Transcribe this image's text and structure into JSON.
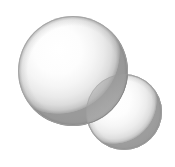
{
  "figure": {
    "type": "illustration",
    "background_color": "#ffffff",
    "width": 175,
    "height": 167,
    "alt_text": "Two overlapping shaded spheres, a large one at upper left and a smaller one at lower right, with a darker lens-shaped intersection region"
  },
  "palette": {
    "background": "#ffffff",
    "highlight": "#ffffff",
    "body_light": "#f7f7f7",
    "body_mid": "#e3e3e3",
    "rim_gray": "#b9b9b9",
    "rim_dark": "#8f8f8f",
    "outline": "#9c9c9c",
    "lens_fill": "#a8a8a8",
    "lens_edge": "#7d7d7d"
  },
  "shapes": [
    {
      "name": "large-sphere",
      "label": "Large sphere",
      "cx": 73,
      "cy": 71,
      "r": 55,
      "highlight_cx": 58,
      "highlight_cy": 52,
      "highlight_r": 62,
      "opacity": 1
    },
    {
      "name": "small-sphere",
      "label": "Small sphere",
      "cx": 124,
      "cy": 112,
      "r": 38,
      "highlight_cx": 113,
      "highlight_cy": 100,
      "highlight_r": 43,
      "opacity": 1
    }
  ],
  "intersection": {
    "name": "lens-region",
    "label": "Intersection lens",
    "opacity": 0.42
  }
}
